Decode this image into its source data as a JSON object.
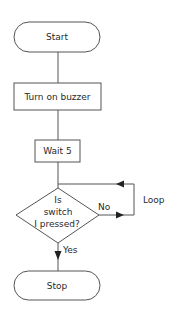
{
  "flowchart": {
    "nodes": {
      "start": {
        "type": "terminator",
        "label": "Start"
      },
      "buzzer": {
        "type": "process",
        "label": "Turn on buzzer"
      },
      "wait": {
        "type": "process",
        "label": "Wait 5"
      },
      "decision": {
        "type": "decision",
        "line1": "Is",
        "line2": "switch",
        "line3": "I pressed?"
      },
      "stop": {
        "type": "terminator",
        "label": "Stop"
      }
    },
    "edges": {
      "no_label": "No",
      "yes_label": "Yes",
      "loop_label": "Loop"
    },
    "colors": {
      "stroke": "#555555",
      "text": "#2a2a2a",
      "background": "#ffffff"
    }
  }
}
